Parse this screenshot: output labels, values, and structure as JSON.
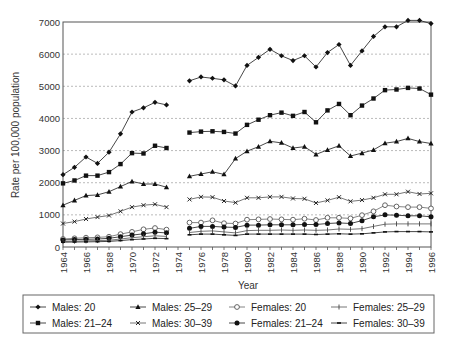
{
  "chart_data": {
    "type": "line",
    "title": "",
    "xlabel": "Year",
    "ylabel": "Rate per 100,000 population",
    "ylim": [
      0,
      7000
    ],
    "xlim": [
      1964,
      1996
    ],
    "yticks": [
      0,
      1000,
      2000,
      3000,
      4000,
      5000,
      6000,
      7000
    ],
    "xticks": [
      1964,
      1966,
      1968,
      1970,
      1972,
      1974,
      1976,
      1978,
      1980,
      1982,
      1984,
      1986,
      1988,
      1990,
      1992,
      1994,
      1996
    ],
    "grid": "horizontal dotted",
    "legend_position": "bottom",
    "x": [
      1964,
      1965,
      1966,
      1967,
      1968,
      1969,
      1970,
      1971,
      1972,
      1973,
      1974,
      1975,
      1976,
      1977,
      1978,
      1979,
      1980,
      1981,
      1982,
      1983,
      1984,
      1985,
      1986,
      1987,
      1988,
      1989,
      1990,
      1991,
      1992,
      1993,
      1994,
      1995,
      1996
    ],
    "series": [
      {
        "name": "Males: 20",
        "marker": "diamond",
        "values": [
          2250,
          2480,
          2800,
          2600,
          2950,
          3520,
          4200,
          4330,
          4500,
          4420,
          null,
          5170,
          5290,
          5250,
          5200,
          5010,
          5650,
          5900,
          6150,
          5950,
          5800,
          5950,
          5600,
          6050,
          6300,
          5650,
          6100,
          6550,
          6850,
          6850,
          7050,
          7050,
          6950
        ]
      },
      {
        "name": "Males: 21-24",
        "marker": "square",
        "values": [
          1980,
          2070,
          2220,
          2220,
          2330,
          2580,
          2920,
          2910,
          3150,
          3080,
          null,
          3560,
          3590,
          3600,
          3580,
          3530,
          3800,
          3960,
          4100,
          4180,
          4080,
          4200,
          3880,
          4250,
          4450,
          4100,
          4400,
          4620,
          4880,
          4900,
          4950,
          4930,
          4740
        ]
      },
      {
        "name": "Males: 25-29",
        "marker": "triangle",
        "values": [
          1300,
          1450,
          1600,
          1620,
          1720,
          1880,
          2040,
          1960,
          1960,
          1860,
          null,
          2200,
          2270,
          2340,
          2260,
          2750,
          2980,
          3120,
          3290,
          3240,
          3080,
          3120,
          2880,
          3020,
          3150,
          2830,
          2920,
          3020,
          3230,
          3280,
          3380,
          3280,
          3220
        ]
      },
      {
        "name": "Males: 30-39",
        "marker": "x",
        "values": [
          730,
          790,
          870,
          930,
          980,
          1110,
          1240,
          1300,
          1330,
          1240,
          null,
          1480,
          1560,
          1550,
          1430,
          1380,
          1530,
          1530,
          1560,
          1560,
          1510,
          1500,
          1370,
          1450,
          1550,
          1420,
          1460,
          1530,
          1640,
          1640,
          1720,
          1650,
          1670
        ]
      },
      {
        "name": "Females: 20",
        "marker": "circle-open",
        "values": [
          250,
          270,
          290,
          300,
          320,
          400,
          470,
          550,
          590,
          540,
          null,
          760,
          760,
          830,
          740,
          730,
          850,
          860,
          870,
          860,
          850,
          880,
          840,
          910,
          910,
          890,
          990,
          1110,
          1300,
          1260,
          1240,
          1240,
          1200
        ]
      },
      {
        "name": "Females: 21-24",
        "marker": "circle-filled",
        "values": [
          220,
          230,
          240,
          250,
          270,
          320,
          370,
          410,
          460,
          440,
          null,
          580,
          640,
          640,
          620,
          610,
          680,
          680,
          690,
          690,
          690,
          700,
          700,
          730,
          750,
          730,
          820,
          940,
          1000,
          990,
          970,
          970,
          940
        ]
      },
      {
        "name": "Females: 25-29",
        "marker": "plus",
        "values": [
          170,
          180,
          190,
          200,
          210,
          250,
          290,
          320,
          350,
          330,
          null,
          450,
          490,
          500,
          470,
          440,
          510,
          520,
          520,
          530,
          520,
          530,
          520,
          530,
          560,
          550,
          570,
          640,
          710,
          720,
          720,
          720,
          720
        ]
      },
      {
        "name": "Females: 30-39",
        "marker": "dash",
        "values": [
          150,
          155,
          160,
          165,
          175,
          200,
          230,
          250,
          270,
          260,
          null,
          380,
          400,
          400,
          380,
          360,
          400,
          400,
          400,
          400,
          400,
          400,
          390,
          400,
          410,
          400,
          410,
          440,
          470,
          480,
          480,
          480,
          470
        ]
      }
    ]
  }
}
